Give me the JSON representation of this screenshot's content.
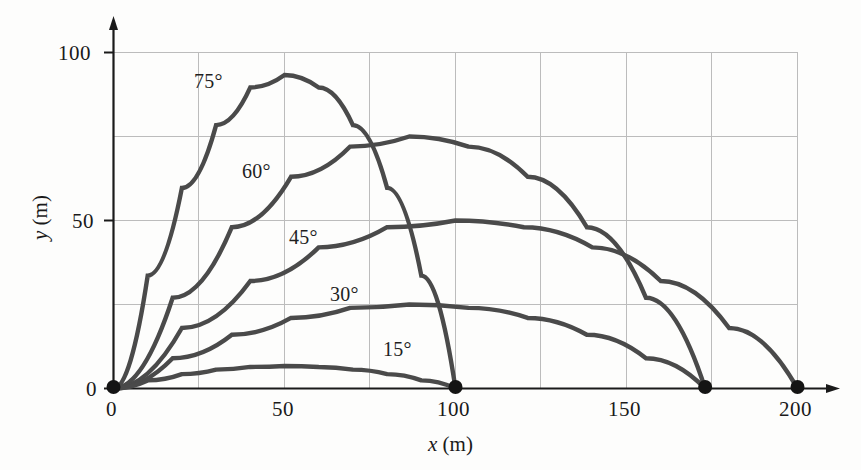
{
  "chart_data": {
    "type": "line",
    "title": "",
    "subtitle": "",
    "xlabel": "x (m)",
    "ylabel": "y (m)",
    "xlim": [
      0,
      200
    ],
    "ylim": [
      0,
      100
    ],
    "xticks": [
      0,
      50,
      100,
      150,
      200
    ],
    "yticks": [
      0,
      50,
      100
    ],
    "xtick_labels": [
      "0",
      "50",
      "100",
      "150",
      "200"
    ],
    "ytick_labels": [
      "0",
      "50",
      "100"
    ],
    "grid": true,
    "grid_spacing_x": 25,
    "grid_spacing_y": 25,
    "legend_position": "inline-annotations",
    "series": [
      {
        "name": "15°",
        "launch_angle_deg": 15,
        "range_m": 100,
        "max_height_m": 6.7,
        "apex_x_m": 50,
        "color": "#4a4a4a",
        "points": [
          [
            0,
            0
          ],
          [
            10,
            2.41
          ],
          [
            20,
            4.28
          ],
          [
            30,
            5.62
          ],
          [
            40,
            6.42
          ],
          [
            50,
            6.7
          ],
          [
            60,
            6.42
          ],
          [
            70,
            5.62
          ],
          [
            80,
            4.28
          ],
          [
            90,
            2.41
          ],
          [
            100,
            0
          ]
        ]
      },
      {
        "name": "30°",
        "launch_angle_deg": 30,
        "range_m": 173,
        "max_height_m": 25,
        "apex_x_m": 86.5,
        "color": "#4a4a4a",
        "points": [
          [
            0,
            0
          ],
          [
            17.3,
            9.0
          ],
          [
            34.6,
            16.0
          ],
          [
            51.9,
            21.0
          ],
          [
            69.2,
            24.0
          ],
          [
            86.5,
            25.0
          ],
          [
            103.8,
            24.0
          ],
          [
            121.1,
            21.0
          ],
          [
            138.4,
            16.0
          ],
          [
            155.7,
            9.0
          ],
          [
            173,
            0
          ]
        ]
      },
      {
        "name": "45°",
        "launch_angle_deg": 45,
        "range_m": 200,
        "max_height_m": 50,
        "apex_x_m": 100,
        "color": "#4a4a4a",
        "points": [
          [
            0,
            0
          ],
          [
            20,
            18.0
          ],
          [
            40,
            32.0
          ],
          [
            60,
            42.0
          ],
          [
            80,
            48.0
          ],
          [
            100,
            50.0
          ],
          [
            120,
            48.0
          ],
          [
            140,
            42.0
          ],
          [
            160,
            32.0
          ],
          [
            180,
            18.0
          ],
          [
            200,
            0
          ]
        ]
      },
      {
        "name": "60°",
        "launch_angle_deg": 60,
        "range_m": 173,
        "max_height_m": 75,
        "apex_x_m": 86.5,
        "color": "#4a4a4a",
        "points": [
          [
            0,
            0
          ],
          [
            17.3,
            27.0
          ],
          [
            34.6,
            48.0
          ],
          [
            51.9,
            63.0
          ],
          [
            69.2,
            72.0
          ],
          [
            86.5,
            75.0
          ],
          [
            103.8,
            72.0
          ],
          [
            121.1,
            63.0
          ],
          [
            138.4,
            48.0
          ],
          [
            155.7,
            27.0
          ],
          [
            173,
            0
          ]
        ]
      },
      {
        "name": "75°",
        "launch_angle_deg": 75,
        "range_m": 100,
        "max_height_m": 93.3,
        "apex_x_m": 50,
        "color": "#4a4a4a",
        "points": [
          [
            0,
            0
          ],
          [
            10,
            33.6
          ],
          [
            20,
            59.7
          ],
          [
            30,
            78.4
          ],
          [
            40,
            89.6
          ],
          [
            50,
            93.3
          ],
          [
            60,
            89.6
          ],
          [
            70,
            78.4
          ],
          [
            80,
            59.7
          ],
          [
            90,
            33.6
          ],
          [
            100,
            0
          ]
        ]
      }
    ],
    "landing_markers": [
      {
        "x": 0,
        "y": 0,
        "label": "launch point"
      },
      {
        "x": 100,
        "y": 0,
        "label": "range 100 m (15° and 75°)"
      },
      {
        "x": 173,
        "y": 0,
        "label": "range 173 m (30° and 60°)"
      },
      {
        "x": 200,
        "y": 0,
        "label": "range 200 m (45°)"
      }
    ],
    "annotations": [
      {
        "text": "75°",
        "x_m": 24,
        "y_m": 85
      },
      {
        "text": "60°",
        "x_m": 38,
        "y_m": 58
      },
      {
        "text": "45°",
        "x_m": 52,
        "y_m": 39
      },
      {
        "text": "30°",
        "x_m": 64,
        "y_m": 22
      },
      {
        "text": "15°",
        "x_m": 79,
        "y_m": 6
      }
    ],
    "colors": {
      "curve": "#4a4a4a",
      "grid": "#b9b9b9",
      "axis": "#1a1a1a",
      "marker": "#1a1a1a",
      "background": "#fdfdfc"
    }
  }
}
